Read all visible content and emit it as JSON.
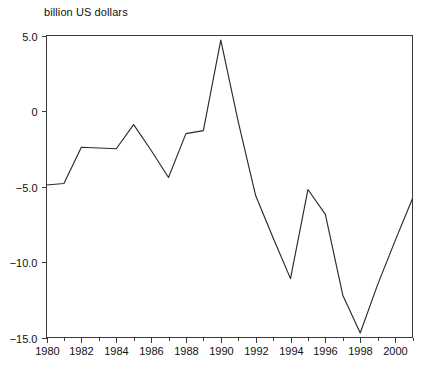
{
  "chart_data": {
    "type": "line",
    "title": "billion US dollars",
    "xlabel": "",
    "ylabel": "billion US dollars",
    "xlim": [
      1980,
      2001
    ],
    "ylim": [
      -15.0,
      5.0
    ],
    "grid": false,
    "legend": null,
    "y_ticks": [
      5.0,
      0,
      -5.0,
      -10.0,
      -15.0
    ],
    "y_tick_labels": [
      "5.0",
      "0",
      "-5.0",
      "-10.0",
      "-15.0"
    ],
    "x_ticks": [
      1980,
      1982,
      1984,
      1986,
      1988,
      1990,
      1992,
      1994,
      1996,
      1998,
      2000
    ],
    "x_tick_labels": [
      "1980",
      "1982",
      "1984",
      "1986",
      "1988",
      "1990",
      "1992",
      "1994",
      "1996",
      "1998",
      "2000"
    ],
    "x_minor_ticks": [
      1981,
      1983,
      1985,
      1987,
      1989,
      1991,
      1993,
      1995,
      1997,
      1999,
      2001
    ],
    "x": [
      1980,
      1981,
      1982,
      1983,
      1984,
      1985,
      1986,
      1987,
      1988,
      1989,
      1990,
      1991,
      1992,
      1993,
      1994,
      1995,
      1996,
      1997,
      1998,
      1999,
      2000,
      2001
    ],
    "values": [
      -4.9,
      -4.8,
      -2.4,
      -2.45,
      -2.5,
      -0.9,
      -2.6,
      -4.4,
      -1.5,
      -1.3,
      4.7,
      -0.7,
      -5.6,
      -8.4,
      -11.1,
      -5.2,
      -6.85,
      -12.2,
      -14.7,
      -11.5,
      -8.6,
      -5.8
    ],
    "series": [
      {
        "name": "balance",
        "values": [
          -4.9,
          -4.8,
          -2.4,
          -2.45,
          -2.5,
          -0.9,
          -2.6,
          -4.4,
          -1.5,
          -1.3,
          4.7,
          -0.7,
          -5.6,
          -8.4,
          -11.1,
          -5.2,
          -6.85,
          -12.2,
          -14.7,
          -11.5,
          -8.6,
          -5.8
        ]
      }
    ],
    "line_color": "#2b2b2b",
    "axis_color": "#3a3a3a",
    "background_color": "#ffffff"
  }
}
